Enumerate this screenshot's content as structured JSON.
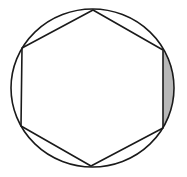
{
  "diagram": {
    "type": "geometry",
    "canvas": {
      "width": 187,
      "height": 177,
      "background": "#ffffff"
    },
    "circle": {
      "cx": 92.5,
      "cy": 88,
      "rx": 81.5,
      "ry": 79,
      "stroke": "#1a1a1a",
      "stroke_width": 1.6,
      "fill": "none"
    },
    "hexagon": {
      "vertices": [
        {
          "name": "top",
          "x": 93,
          "y": 10
        },
        {
          "name": "upper-right",
          "x": 163,
          "y": 50
        },
        {
          "name": "lower-right",
          "x": 163,
          "y": 128
        },
        {
          "name": "bottom",
          "x": 91,
          "y": 166
        },
        {
          "name": "lower-left",
          "x": 21,
          "y": 126
        },
        {
          "name": "upper-left",
          "x": 22,
          "y": 48
        }
      ],
      "stroke": "#1a1a1a",
      "stroke_width": 1.6,
      "fill": "none"
    },
    "shaded_segment": {
      "between_vertices": [
        "upper-right",
        "lower-right"
      ],
      "fill": "#b8b8b8"
    }
  }
}
